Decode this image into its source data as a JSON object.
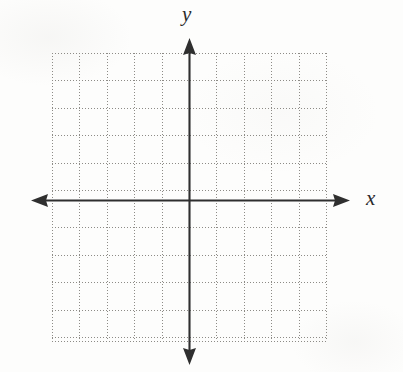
{
  "figure": {
    "kind": "coordinate-plane",
    "title": "",
    "background_color": "#fdfdfc",
    "axis_color": "#2f2f2f",
    "grid_color": "#8d8b86",
    "label_color": "#2b2b2b"
  },
  "axes": {
    "x": {
      "label": "x",
      "arrow_left": true,
      "arrow_right": true,
      "pixel_y": 200,
      "pixel_x_start": 31,
      "pixel_x_end": 350
    },
    "y": {
      "label": "y",
      "arrow_up": true,
      "arrow_down": true,
      "pixel_x": 189,
      "pixel_y_start": 38,
      "pixel_y_end": 365
    }
  },
  "grid": {
    "style": "dotted",
    "left": 52,
    "top": 53,
    "width": 274,
    "height": 288,
    "cell_size": 27.4,
    "columns": 10,
    "rows": 10.5,
    "vertical_lines": [
      0,
      27.4,
      54.8,
      82.2,
      109.6,
      137,
      164.4,
      191.8,
      219.2,
      246.6,
      274
    ],
    "horizontal_lines": [
      0,
      27.4,
      54.8,
      82.2,
      109.6,
      137,
      147,
      174.4,
      201.8,
      229.2,
      256.6,
      284,
      288
    ]
  },
  "chart_data": {
    "type": "scatter",
    "title": "",
    "xlabel": "x",
    "ylabel": "y",
    "series": [],
    "x": [],
    "values": [],
    "xlim": [
      -5,
      5
    ],
    "ylim": [
      -5,
      5.5
    ],
    "grid": true,
    "grid_style": "dotted",
    "legend": "none",
    "xticks": [],
    "yticks": [],
    "annotations": []
  }
}
